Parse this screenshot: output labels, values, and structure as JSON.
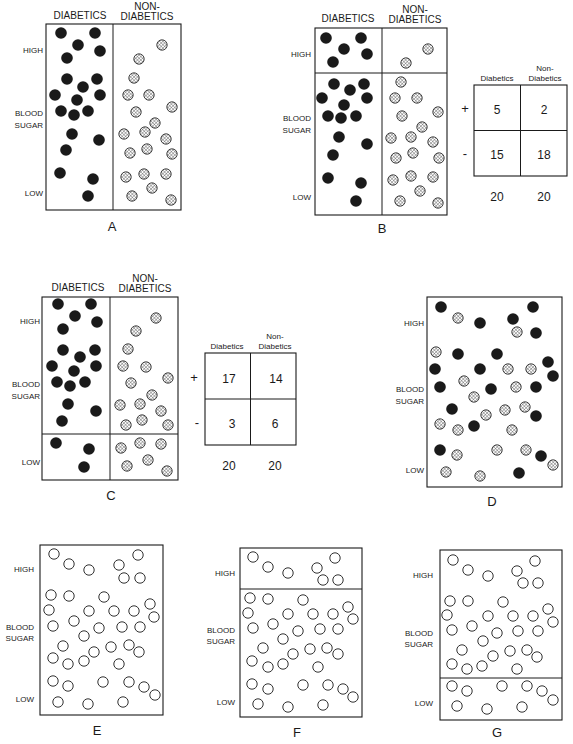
{
  "colors": {
    "ink": "#1a1a1a",
    "background": "#ffffff",
    "hatch_fill": "#ffffff"
  },
  "legend_axis": {
    "high": "HIGH",
    "blood": "BLOOD",
    "sugar": "SUGAR",
    "low": "LOW"
  },
  "group_headers": {
    "diabetics": "DIABETICS",
    "non_line1": "NON-",
    "non_line2": "DIABETICS"
  },
  "table_headers": {
    "diabetics": "Diabetics",
    "non_line1": "Non-",
    "non_line2": "Diabetics"
  },
  "panels": {
    "A": {
      "label": "A",
      "box": [
        46,
        24,
        181,
        210
      ],
      "divider_x": 113,
      "filled": [
        [
          61,
          33
        ],
        [
          95,
          33
        ],
        [
          78,
          45
        ],
        [
          100,
          51
        ],
        [
          67,
          58
        ],
        [
          67,
          79
        ],
        [
          97,
          79
        ],
        [
          83,
          87
        ],
        [
          55,
          95
        ],
        [
          100,
          95
        ],
        [
          77,
          100
        ],
        [
          61,
          111
        ],
        [
          74,
          115
        ],
        [
          88,
          111
        ],
        [
          72,
          134
        ],
        [
          99,
          140
        ],
        [
          66,
          150
        ],
        [
          60,
          173
        ],
        [
          93,
          179
        ],
        [
          88,
          196
        ]
      ],
      "hatched": [
        [
          162,
          45
        ],
        [
          139,
          59
        ],
        [
          134,
          78
        ],
        [
          128,
          95
        ],
        [
          149,
          95
        ],
        [
          172,
          107
        ],
        [
          136,
          112
        ],
        [
          155,
          123
        ],
        [
          124,
          134
        ],
        [
          145,
          132
        ],
        [
          166,
          139
        ],
        [
          130,
          153
        ],
        [
          147,
          149
        ],
        [
          172,
          154
        ],
        [
          126,
          177
        ],
        [
          144,
          174
        ],
        [
          166,
          174
        ],
        [
          132,
          196
        ],
        [
          152,
          188
        ],
        [
          171,
          200
        ]
      ]
    },
    "B": {
      "label": "B",
      "box": [
        315,
        28,
        447,
        215
      ],
      "divider_x": 382,
      "threshold_y": 73,
      "filled": [
        [
          326,
          38
        ],
        [
          361,
          38
        ],
        [
          344,
          49
        ],
        [
          367,
          54
        ],
        [
          333,
          62
        ],
        [
          334,
          84
        ],
        [
          364,
          84
        ],
        [
          350,
          90
        ],
        [
          322,
          98
        ],
        [
          367,
          98
        ],
        [
          344,
          105
        ],
        [
          328,
          116
        ],
        [
          341,
          118
        ],
        [
          356,
          116
        ],
        [
          339,
          137
        ],
        [
          367,
          144
        ],
        [
          333,
          155
        ],
        [
          328,
          178
        ],
        [
          361,
          183
        ],
        [
          356,
          201
        ]
      ],
      "hatched": [
        [
          428,
          49
        ],
        [
          406,
          63
        ],
        [
          401,
          82
        ],
        [
          395,
          98
        ],
        [
          417,
          98
        ],
        [
          438,
          112
        ],
        [
          402,
          116
        ],
        [
          422,
          127
        ],
        [
          391,
          138
        ],
        [
          411,
          137
        ],
        [
          433,
          142
        ],
        [
          396,
          158
        ],
        [
          413,
          153
        ],
        [
          439,
          158
        ],
        [
          393,
          180
        ],
        [
          411,
          176
        ],
        [
          433,
          177
        ],
        [
          400,
          201
        ],
        [
          420,
          191
        ],
        [
          438,
          203
        ]
      ],
      "table": {
        "box": [
          474,
          85,
          567,
          176
        ],
        "row_signs": [
          "+",
          "-"
        ],
        "cells": [
          [
            "5",
            "2"
          ],
          [
            "15",
            "18"
          ]
        ],
        "totals": [
          "20",
          "20"
        ]
      }
    },
    "C": {
      "label": "C",
      "box": [
        42,
        297,
        178,
        480
      ],
      "divider_x": 110,
      "threshold_y": 434,
      "filled": [
        [
          58,
          304
        ],
        [
          91,
          304
        ],
        [
          75,
          316
        ],
        [
          97,
          322
        ],
        [
          63,
          329
        ],
        [
          63,
          350
        ],
        [
          95,
          350
        ],
        [
          80,
          357
        ],
        [
          52,
          366
        ],
        [
          96,
          366
        ],
        [
          74,
          371
        ],
        [
          57,
          382
        ],
        [
          70,
          386
        ],
        [
          85,
          382
        ],
        [
          68,
          404
        ],
        [
          96,
          411
        ],
        [
          62,
          421
        ],
        [
          56,
          443
        ],
        [
          89,
          449
        ],
        [
          84,
          467
        ]
      ],
      "hatched": [
        [
          156,
          318
        ],
        [
          136,
          331
        ],
        [
          128,
          349
        ],
        [
          123,
          366
        ],
        [
          146,
          367
        ],
        [
          168,
          378
        ],
        [
          131,
          383
        ],
        [
          152,
          395
        ],
        [
          120,
          405
        ],
        [
          140,
          404
        ],
        [
          161,
          411
        ],
        [
          126,
          425
        ],
        [
          142,
          420
        ],
        [
          168,
          425
        ],
        [
          121,
          448
        ],
        [
          140,
          443
        ],
        [
          161,
          444
        ],
        [
          127,
          466
        ],
        [
          148,
          460
        ],
        [
          167,
          471
        ]
      ],
      "table": {
        "box": [
          205,
          353,
          296,
          445
        ],
        "row_signs": [
          "+",
          "-"
        ],
        "cells": [
          [
            "17",
            "14"
          ],
          [
            "3",
            "6"
          ]
        ],
        "totals": [
          "20",
          "20"
        ]
      }
    },
    "D": {
      "label": "D",
      "box": [
        427,
        297,
        562,
        487
      ],
      "filled": [
        [
          441,
          307
        ],
        [
          533,
          307
        ],
        [
          513,
          319
        ],
        [
          480,
          323
        ],
        [
          536,
          333
        ],
        [
          458,
          354
        ],
        [
          497,
          354
        ],
        [
          548,
          362
        ],
        [
          435,
          369
        ],
        [
          480,
          369
        ],
        [
          553,
          376
        ],
        [
          440,
          387
        ],
        [
          491,
          389
        ],
        [
          536,
          387
        ],
        [
          452,
          409
        ],
        [
          536,
          416
        ],
        [
          474,
          426
        ],
        [
          440,
          450
        ],
        [
          541,
          456
        ],
        [
          519,
          473
        ]
      ],
      "hatched": [
        [
          458,
          318
        ],
        [
          517,
          332
        ],
        [
          436,
          352
        ],
        [
          508,
          369
        ],
        [
          531,
          369
        ],
        [
          464,
          381
        ],
        [
          516,
          387
        ],
        [
          474,
          397
        ],
        [
          505,
          410
        ],
        [
          525,
          407
        ],
        [
          486,
          415
        ],
        [
          440,
          424
        ],
        [
          458,
          430
        ],
        [
          512,
          430
        ],
        [
          497,
          450
        ],
        [
          457,
          455
        ],
        [
          526,
          450
        ],
        [
          553,
          465
        ],
        [
          446,
          472
        ],
        [
          480,
          476
        ]
      ]
    },
    "E": {
      "label": "E",
      "box": [
        40,
        545,
        163,
        715
      ],
      "open": [
        [
          54,
          554
        ],
        [
          138,
          555
        ],
        [
          69,
          564
        ],
        [
          89,
          570
        ],
        [
          119,
          565
        ],
        [
          124,
          578
        ],
        [
          140,
          578
        ],
        [
          51,
          595
        ],
        [
          69,
          596
        ],
        [
          104,
          597
        ],
        [
          150,
          604
        ],
        [
          49,
          610
        ],
        [
          89,
          611
        ],
        [
          114,
          611
        ],
        [
          134,
          611
        ],
        [
          154,
          617
        ],
        [
          53,
          626
        ],
        [
          74,
          621
        ],
        [
          99,
          628
        ],
        [
          122,
          627
        ],
        [
          140,
          627
        ],
        [
          84,
          636
        ],
        [
          63,
          646
        ],
        [
          94,
          652
        ],
        [
          111,
          647
        ],
        [
          129,
          645
        ],
        [
          139,
          652
        ],
        [
          53,
          658
        ],
        [
          68,
          664
        ],
        [
          84,
          661
        ],
        [
          119,
          664
        ],
        [
          53,
          681
        ],
        [
          68,
          686
        ],
        [
          103,
          682
        ],
        [
          129,
          682
        ],
        [
          144,
          687
        ],
        [
          155,
          695
        ],
        [
          58,
          702
        ],
        [
          88,
          704
        ],
        [
          123,
          702
        ]
      ]
    },
    "F": {
      "label": "F",
      "box": [
        240,
        548,
        362,
        717
      ],
      "threshold_y": 589,
      "open": [
        [
          253,
          557
        ],
        [
          335,
          558
        ],
        [
          268,
          567
        ],
        [
          288,
          573
        ],
        [
          317,
          568
        ],
        [
          323,
          580
        ],
        [
          338,
          580
        ],
        [
          250,
          598
        ],
        [
          268,
          599
        ],
        [
          303,
          600
        ],
        [
          348,
          607
        ],
        [
          248,
          613
        ],
        [
          288,
          614
        ],
        [
          313,
          614
        ],
        [
          333,
          614
        ],
        [
          353,
          619
        ],
        [
          253,
          628
        ],
        [
          273,
          624
        ],
        [
          298,
          631
        ],
        [
          320,
          629
        ],
        [
          338,
          629
        ],
        [
          283,
          639
        ],
        [
          263,
          648
        ],
        [
          293,
          654
        ],
        [
          310,
          649
        ],
        [
          327,
          648
        ],
        [
          338,
          654
        ],
        [
          252,
          661
        ],
        [
          268,
          667
        ],
        [
          283,
          664
        ],
        [
          318,
          667
        ],
        [
          252,
          684
        ],
        [
          268,
          689
        ],
        [
          303,
          685
        ],
        [
          328,
          685
        ],
        [
          343,
          689
        ],
        [
          353,
          697
        ],
        [
          258,
          704
        ],
        [
          288,
          707
        ],
        [
          323,
          705
        ]
      ]
    },
    "G": {
      "label": "G",
      "box": [
        440,
        550,
        562,
        720
      ],
      "threshold_y": 678,
      "open": [
        [
          453,
          560
        ],
        [
          535,
          561
        ],
        [
          468,
          570
        ],
        [
          488,
          576
        ],
        [
          517,
          571
        ],
        [
          523,
          583
        ],
        [
          538,
          583
        ],
        [
          450,
          601
        ],
        [
          468,
          601
        ],
        [
          503,
          602
        ],
        [
          548,
          609
        ],
        [
          447,
          615
        ],
        [
          488,
          616
        ],
        [
          513,
          616
        ],
        [
          533,
          616
        ],
        [
          553,
          622
        ],
        [
          452,
          630
        ],
        [
          472,
          626
        ],
        [
          497,
          633
        ],
        [
          518,
          631
        ],
        [
          538,
          631
        ],
        [
          483,
          641
        ],
        [
          462,
          650
        ],
        [
          493,
          656
        ],
        [
          510,
          651
        ],
        [
          527,
          650
        ],
        [
          537,
          657
        ],
        [
          452,
          664
        ],
        [
          467,
          669
        ],
        [
          482,
          666
        ],
        [
          517,
          669
        ],
        [
          452,
          686
        ],
        [
          467,
          691
        ],
        [
          502,
          686
        ],
        [
          527,
          686
        ],
        [
          542,
          691
        ],
        [
          553,
          700
        ],
        [
          457,
          706
        ],
        [
          487,
          709
        ],
        [
          522,
          707
        ]
      ]
    }
  }
}
